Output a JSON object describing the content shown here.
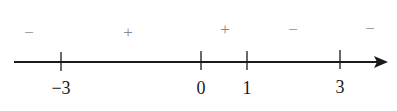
{
  "diagram": {
    "type": "number-line-sign-chart",
    "axis": {
      "x_start": 14,
      "x_end": 387,
      "y": 62,
      "color": "#1a1a1a"
    },
    "ticks": [
      {
        "label": "−3",
        "value": -3,
        "x": 61
      },
      {
        "label": "0",
        "value": 0,
        "x": 201
      },
      {
        "label": "1",
        "value": 1,
        "x": 247
      },
      {
        "label": "3",
        "value": 3,
        "x": 340
      }
    ],
    "signs": [
      {
        "symbol": "−",
        "x": 29,
        "y": 38,
        "interval": "(-∞, -3)"
      },
      {
        "symbol": "+",
        "x": 128,
        "y": 38,
        "interval": "(-3, 0)"
      },
      {
        "symbol": "+",
        "x": 225,
        "y": 35,
        "interval": "(0, 1)"
      },
      {
        "symbol": "−",
        "x": 293,
        "y": 35,
        "interval": "(1, 3)"
      },
      {
        "symbol": "−",
        "x": 370,
        "y": 34,
        "interval": "(3, ∞)"
      }
    ],
    "sign_color": "#8a8a8a"
  }
}
